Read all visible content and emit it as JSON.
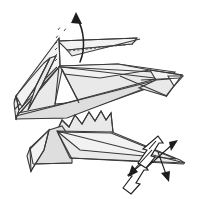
{
  "figure": {
    "kind": "origami-fold-diagram",
    "title": "",
    "background_color": "#ffffff",
    "line_color": "#3a3a3a",
    "fill_light": "#f2f2f2",
    "fill_mid": "#e9e9e9",
    "fill_dark": "#dedede",
    "arrow_color": "#1d1d1d",
    "canvas": {
      "width": 197,
      "height": 199
    }
  },
  "elements": {
    "body": {
      "label": "folded paper body",
      "fill": "#e9e9e9"
    },
    "upper_flap": {
      "label": "upper long flap",
      "fill": "#f2f2f2"
    },
    "left_panel": {
      "label": "left folded panel",
      "fill": "#e9e9e9"
    },
    "beak": {
      "label": "right pointed tip",
      "fill": "#f2f2f2"
    },
    "sawtooth": {
      "label": "sawtooth edge",
      "fill": "#e9e9e9"
    },
    "lower_leg": {
      "label": "lower leg flap",
      "fill": "#dedede"
    },
    "tail": {
      "label": "lower tail spike",
      "fill": "#e9e9e9"
    }
  },
  "annotations": {
    "fold_arrow_up": {
      "name": "curved-fold-arrow",
      "direction": "up",
      "style": "solid-curved"
    },
    "crease_dashes": {
      "name": "dashed-crease-lines",
      "style": "dashed",
      "count": 7
    },
    "flap_dotted_edge": {
      "name": "dotted-flap-edge",
      "style": "dotted"
    },
    "push_arrow_large": {
      "name": "hollow-push-arrow",
      "direction": "up-right"
    },
    "pull_arrow_large": {
      "name": "hollow-pull-arrow",
      "direction": "up-right"
    },
    "thin_arrow_ne": {
      "name": "thin-arrow-northeast",
      "direction": "north-east"
    },
    "thin_arrow_sw": {
      "name": "thin-arrow-southwest",
      "direction": "south-west"
    },
    "thin_arrow_se": {
      "name": "thin-arrow-southeast",
      "direction": "south-east"
    }
  }
}
